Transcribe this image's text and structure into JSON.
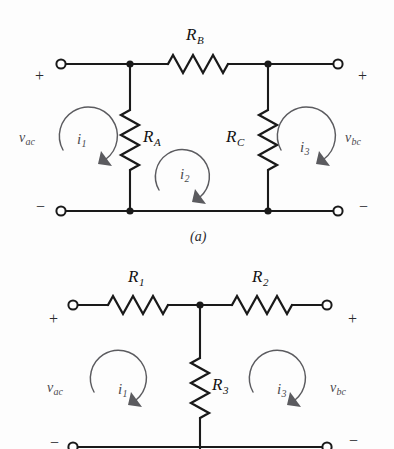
{
  "figure": {
    "kind": "electrical-circuit-schematic",
    "background_color": "#fdfdfd",
    "wire_color": "#1a1a1a",
    "arrow_color": "#5b5b5f"
  },
  "circuit_a": {
    "caption": "(a)",
    "terminal_signs": {
      "left_top": "+",
      "left_bottom": "−",
      "right_top": "+",
      "right_bottom": "−"
    },
    "port_voltages": {
      "left": {
        "symbol": "v",
        "subscript": "ac"
      },
      "right": {
        "symbol": "v",
        "subscript": "bc"
      }
    },
    "resistors": [
      {
        "name": "R_B",
        "symbol": "R",
        "subscript": "B",
        "orientation": "horizontal",
        "position": "top-branch"
      },
      {
        "name": "R_A",
        "symbol": "R",
        "subscript": "A",
        "orientation": "vertical",
        "position": "left-shunt"
      },
      {
        "name": "R_C",
        "symbol": "R",
        "subscript": "C",
        "orientation": "vertical",
        "position": "right-shunt"
      }
    ],
    "mesh_currents": [
      {
        "name": "i_1",
        "symbol": "i",
        "subscript": "1",
        "direction": "clockwise",
        "mesh": "left"
      },
      {
        "name": "i_2",
        "symbol": "i",
        "subscript": "2",
        "direction": "clockwise",
        "mesh": "middle"
      },
      {
        "name": "i_3",
        "symbol": "i",
        "subscript": "3",
        "direction": "clockwise",
        "mesh": "right"
      }
    ]
  },
  "circuit_b": {
    "caption": "",
    "terminal_signs": {
      "left_top": "+",
      "left_bottom": "−",
      "right_top": "+",
      "right_bottom": "−"
    },
    "port_voltages": {
      "left": {
        "symbol": "v",
        "subscript": "ac"
      },
      "right": {
        "symbol": "v",
        "subscript": "bc"
      }
    },
    "resistors": [
      {
        "name": "R_1",
        "symbol": "R",
        "subscript": "1",
        "orientation": "horizontal",
        "position": "left-series"
      },
      {
        "name": "R_2",
        "symbol": "R",
        "subscript": "2",
        "orientation": "horizontal",
        "position": "right-series"
      },
      {
        "name": "R_3",
        "symbol": "R",
        "subscript": "3",
        "orientation": "vertical",
        "position": "center-shunt"
      }
    ],
    "mesh_currents": [
      {
        "name": "i_1",
        "symbol": "i",
        "subscript": "1",
        "direction": "clockwise",
        "mesh": "left"
      },
      {
        "name": "i_3",
        "symbol": "i",
        "subscript": "3",
        "direction": "clockwise",
        "mesh": "right"
      }
    ]
  },
  "labels": {
    "a_RB": "R",
    "a_RB_sub": "B",
    "a_RA": "R",
    "a_RA_sub": "A",
    "a_RC": "R",
    "a_RC_sub": "C",
    "a_vac": "v",
    "a_vac_sub": "ac",
    "a_vbc": "v",
    "a_vbc_sub": "bc",
    "a_i1": "i",
    "a_i1_sub": "1",
    "a_i2": "i",
    "a_i2_sub": "2",
    "a_i3": "i",
    "a_i3_sub": "3",
    "a_plus_left": "+",
    "a_minus_left": "−",
    "a_plus_right": "+",
    "a_minus_right": "−",
    "a_caption": "(a)",
    "b_R1": "R",
    "b_R1_sub": "1",
    "b_R2": "R",
    "b_R2_sub": "2",
    "b_R3": "R",
    "b_R3_sub": "3",
    "b_vac": "v",
    "b_vac_sub": "ac",
    "b_vbc": "v",
    "b_vbc_sub": "bc",
    "b_i1": "i",
    "b_i1_sub": "1",
    "b_i3": "i",
    "b_i3_sub": "3",
    "b_plus_left": "+",
    "b_plus_right": "+",
    "b_minus_left": "−",
    "b_minus_right": "−"
  }
}
